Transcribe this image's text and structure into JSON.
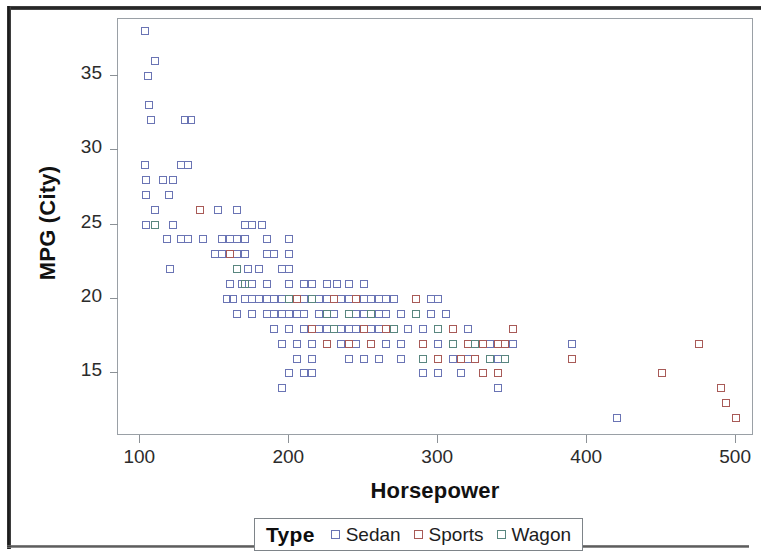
{
  "chart_data": {
    "type": "scatter",
    "title": "",
    "xlabel": "Horsepower",
    "ylabel": "MPG (City)",
    "xlim": [
      85,
      512
    ],
    "ylim": [
      10.8,
      38.8
    ],
    "xticks": [
      100,
      200,
      300,
      400,
      500
    ],
    "yticks": [
      15,
      20,
      25,
      30,
      35
    ],
    "grid": false,
    "legend": {
      "title": "Type",
      "position": "bottom-center",
      "entries": [
        {
          "name": "Sedan",
          "color": "#6a74b4",
          "marker": "square-open"
        },
        {
          "name": "Sports",
          "color": "#a85a57",
          "marker": "square-open"
        },
        {
          "name": "Wagon",
          "color": "#59867f",
          "marker": "square-open"
        }
      ]
    },
    "series": [
      {
        "name": "Sedan",
        "color": "#6a74b4",
        "points": [
          [
            103,
            38
          ],
          [
            110,
            36
          ],
          [
            105,
            35
          ],
          [
            106,
            33
          ],
          [
            107,
            32
          ],
          [
            130,
            32
          ],
          [
            134,
            32
          ],
          [
            103,
            29
          ],
          [
            127,
            29
          ],
          [
            132,
            29
          ],
          [
            104,
            28
          ],
          [
            115,
            28
          ],
          [
            122,
            28
          ],
          [
            104,
            27
          ],
          [
            119,
            27
          ],
          [
            110,
            26
          ],
          [
            140,
            26
          ],
          [
            152,
            26
          ],
          [
            165,
            26
          ],
          [
            104,
            25
          ],
          [
            122,
            25
          ],
          [
            170,
            25
          ],
          [
            175,
            25
          ],
          [
            182,
            25
          ],
          [
            118,
            24
          ],
          [
            127,
            24
          ],
          [
            132,
            24
          ],
          [
            142,
            24
          ],
          [
            155,
            24
          ],
          [
            160,
            24
          ],
          [
            165,
            24
          ],
          [
            170,
            24
          ],
          [
            185,
            24
          ],
          [
            200,
            24
          ],
          [
            120,
            22
          ],
          [
            150,
            23
          ],
          [
            155,
            23
          ],
          [
            160,
            23
          ],
          [
            165,
            23
          ],
          [
            170,
            23
          ],
          [
            185,
            23
          ],
          [
            190,
            23
          ],
          [
            200,
            23
          ],
          [
            165,
            22
          ],
          [
            172,
            22
          ],
          [
            180,
            22
          ],
          [
            195,
            22
          ],
          [
            200,
            22
          ],
          [
            160,
            21
          ],
          [
            168,
            21
          ],
          [
            175,
            21
          ],
          [
            185,
            21
          ],
          [
            200,
            21
          ],
          [
            210,
            21
          ],
          [
            215,
            21
          ],
          [
            225,
            21
          ],
          [
            232,
            21
          ],
          [
            240,
            21
          ],
          [
            250,
            21
          ],
          [
            158,
            20
          ],
          [
            162,
            20
          ],
          [
            170,
            20
          ],
          [
            175,
            20
          ],
          [
            180,
            20
          ],
          [
            185,
            20
          ],
          [
            190,
            20
          ],
          [
            195,
            20
          ],
          [
            200,
            20
          ],
          [
            205,
            20
          ],
          [
            210,
            20
          ],
          [
            215,
            20
          ],
          [
            220,
            20
          ],
          [
            225,
            20
          ],
          [
            230,
            20
          ],
          [
            235,
            20
          ],
          [
            240,
            20
          ],
          [
            245,
            20
          ],
          [
            250,
            20
          ],
          [
            255,
            20
          ],
          [
            260,
            20
          ],
          [
            265,
            20
          ],
          [
            270,
            20
          ],
          [
            285,
            20
          ],
          [
            295,
            20
          ],
          [
            300,
            20
          ],
          [
            165,
            19
          ],
          [
            175,
            19
          ],
          [
            185,
            19
          ],
          [
            190,
            19
          ],
          [
            195,
            19
          ],
          [
            200,
            19
          ],
          [
            205,
            19
          ],
          [
            210,
            19
          ],
          [
            220,
            19
          ],
          [
            230,
            19
          ],
          [
            240,
            19
          ],
          [
            245,
            19
          ],
          [
            250,
            19
          ],
          [
            255,
            19
          ],
          [
            260,
            19
          ],
          [
            265,
            19
          ],
          [
            275,
            19
          ],
          [
            285,
            19
          ],
          [
            295,
            19
          ],
          [
            305,
            19
          ],
          [
            190,
            18
          ],
          [
            200,
            18
          ],
          [
            210,
            18
          ],
          [
            215,
            18
          ],
          [
            220,
            18
          ],
          [
            225,
            18
          ],
          [
            230,
            18
          ],
          [
            235,
            18
          ],
          [
            240,
            18
          ],
          [
            245,
            18
          ],
          [
            250,
            18
          ],
          [
            255,
            18
          ],
          [
            260,
            18
          ],
          [
            265,
            18
          ],
          [
            270,
            18
          ],
          [
            280,
            18
          ],
          [
            290,
            18
          ],
          [
            300,
            18
          ],
          [
            310,
            18
          ],
          [
            320,
            18
          ],
          [
            195,
            17
          ],
          [
            205,
            17
          ],
          [
            215,
            17
          ],
          [
            225,
            17
          ],
          [
            235,
            17
          ],
          [
            245,
            17
          ],
          [
            255,
            17
          ],
          [
            265,
            17
          ],
          [
            275,
            17
          ],
          [
            290,
            17
          ],
          [
            300,
            17
          ],
          [
            310,
            17
          ],
          [
            325,
            17
          ],
          [
            335,
            17
          ],
          [
            345,
            17
          ],
          [
            350,
            17
          ],
          [
            390,
            17
          ],
          [
            205,
            16
          ],
          [
            215,
            16
          ],
          [
            240,
            16
          ],
          [
            250,
            16
          ],
          [
            260,
            16
          ],
          [
            275,
            16
          ],
          [
            290,
            16
          ],
          [
            300,
            16
          ],
          [
            310,
            16
          ],
          [
            320,
            16
          ],
          [
            340,
            16
          ],
          [
            200,
            15
          ],
          [
            210,
            15
          ],
          [
            215,
            15
          ],
          [
            290,
            15
          ],
          [
            300,
            15
          ],
          [
            315,
            15
          ],
          [
            340,
            14
          ],
          [
            195,
            14
          ],
          [
            420,
            12
          ]
        ]
      },
      {
        "name": "Sports",
        "color": "#a85a57",
        "points": [
          [
            140,
            26
          ],
          [
            160,
            23
          ],
          [
            205,
            20
          ],
          [
            230,
            20
          ],
          [
            245,
            20
          ],
          [
            285,
            20
          ],
          [
            215,
            18
          ],
          [
            250,
            18
          ],
          [
            265,
            18
          ],
          [
            300,
            18
          ],
          [
            310,
            18
          ],
          [
            350,
            18
          ],
          [
            225,
            17
          ],
          [
            240,
            17
          ],
          [
            255,
            17
          ],
          [
            290,
            17
          ],
          [
            320,
            17
          ],
          [
            330,
            17
          ],
          [
            340,
            17
          ],
          [
            345,
            17
          ],
          [
            300,
            16
          ],
          [
            315,
            16
          ],
          [
            325,
            16
          ],
          [
            335,
            16
          ],
          [
            345,
            16
          ],
          [
            390,
            16
          ],
          [
            330,
            15
          ],
          [
            340,
            15
          ],
          [
            450,
            15
          ],
          [
            475,
            17
          ],
          [
            490,
            14
          ],
          [
            493,
            13
          ],
          [
            500,
            12
          ]
        ]
      },
      {
        "name": "Wagon",
        "color": "#59867f",
        "points": [
          [
            110,
            25
          ],
          [
            165,
            22
          ],
          [
            170,
            21
          ],
          [
            200,
            20
          ],
          [
            215,
            20
          ],
          [
            225,
            19
          ],
          [
            240,
            19
          ],
          [
            255,
            19
          ],
          [
            285,
            19
          ],
          [
            300,
            18
          ],
          [
            230,
            18
          ],
          [
            270,
            18
          ],
          [
            310,
            17
          ],
          [
            325,
            17
          ],
          [
            290,
            16
          ],
          [
            335,
            16
          ],
          [
            345,
            16
          ]
        ]
      }
    ]
  }
}
